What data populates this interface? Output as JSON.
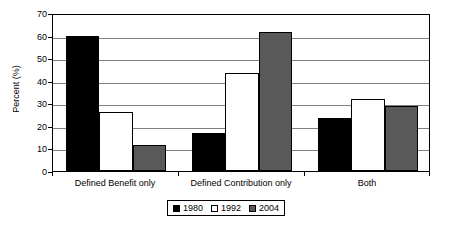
{
  "chart_data": {
    "type": "bar",
    "title": "",
    "subtitle": "",
    "xlabel": "",
    "ylabel": "Percent (%)",
    "ylim": [
      0,
      70
    ],
    "ytick_step": 10,
    "yticks": [
      0,
      10,
      20,
      30,
      40,
      50,
      60,
      70
    ],
    "ytick_labels": [
      "0",
      "10",
      "20",
      "30",
      "40",
      "50",
      "60",
      "70"
    ],
    "grid": true,
    "grid_axis": "y",
    "legend_position": "bottom-center",
    "categories": [
      "Defined Benefit only",
      "Defined Contribution only",
      "Both"
    ],
    "series": [
      {
        "name": "1980",
        "color": "#000000",
        "values": [
          60,
          17,
          23.5
        ]
      },
      {
        "name": "1992",
        "color": "#ffffff",
        "values": [
          26,
          43.5,
          32
        ]
      },
      {
        "name": "2004",
        "color": "#595959",
        "values": [
          11.5,
          61.5,
          29
        ]
      }
    ],
    "annotations": []
  },
  "axis": {
    "y_title": "Percent (%)"
  },
  "legend": {
    "entries": [
      {
        "label": "1980",
        "swatch": "black-square-icon"
      },
      {
        "label": "1992",
        "swatch": "white-square-icon"
      },
      {
        "label": "2004",
        "swatch": "gray-square-icon"
      }
    ]
  },
  "colors": {
    "series_1980": "#000000",
    "series_1992": "#ffffff",
    "series_2004": "#595959",
    "gridline": "#808080",
    "axis": "#000000",
    "background": "#ffffff"
  }
}
